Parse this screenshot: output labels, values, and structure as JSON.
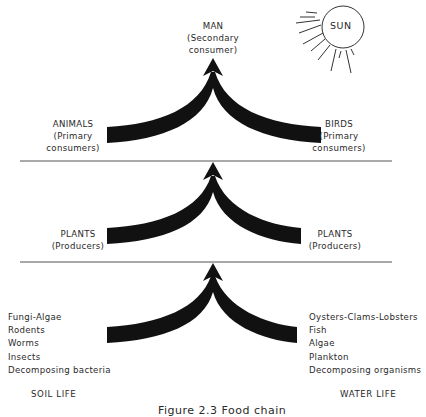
{
  "diagram": {
    "type": "food-chain",
    "sun": {
      "label": "SUN"
    },
    "levels": [
      {
        "name": "secondary-consumer",
        "center": {
          "title": "MAN",
          "subtitle_1": "(Secondary",
          "subtitle_2": "consumer)"
        }
      },
      {
        "name": "primary-consumers",
        "left": {
          "title": "ANIMALS",
          "subtitle_1": "(Primary",
          "subtitle_2": "consumers)"
        },
        "right": {
          "title": "BIRDS",
          "subtitle_1": "(Primary",
          "subtitle_2": "consumers)"
        }
      },
      {
        "name": "producers",
        "left": {
          "title": "PLANTS",
          "subtitle_1": "(Producers)"
        },
        "right": {
          "title": "PLANTS",
          "subtitle_1": "(Producers)"
        }
      },
      {
        "name": "base",
        "left": {
          "items": [
            "Fungi-Algae",
            "Rodents",
            "Worms",
            "Insects",
            "Decomposing bacteria"
          ],
          "footer": "SOIL LIFE"
        },
        "right": {
          "items": [
            "Oysters-Clams-Lobsters",
            "Fish",
            "Algae",
            "Plankton",
            "Decomposing organisms"
          ],
          "footer": "WATER LIFE"
        }
      }
    ],
    "caption": "Figure 2.3   Food chain",
    "colors": {
      "ink": "#111111",
      "text": "#2a2a2a",
      "line": "#555555",
      "background": "#ffffff"
    }
  }
}
